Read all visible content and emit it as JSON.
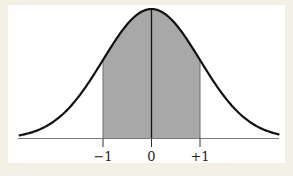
{
  "chart_data": {
    "type": "area",
    "curve": "standard-normal-bell-curve",
    "title": "",
    "xlabel": "",
    "ylabel": "",
    "x_ticks": [
      {
        "sigma": -1,
        "label": "−1"
      },
      {
        "sigma": 0,
        "label": "0"
      },
      {
        "sigma": 1,
        "label": "+1"
      }
    ],
    "shaded_region": {
      "from_sigma": -1,
      "to_sigma": 1
    },
    "center_line_at_sigma": 0,
    "x_domain_sigma": [
      -2.72,
      2.62
    ],
    "grid": false,
    "legend": false,
    "layout": {
      "canvas_w": 293,
      "canvas_h": 176,
      "x0_px": 151.5,
      "sigma_px": 48.5,
      "axis_y_px": 138.5,
      "peak_px": 129.5,
      "axis_x1_px": 18,
      "axis_x2_px": 279,
      "tick_len_px": 8.5,
      "label_baseline_px": 161
    },
    "colors": {
      "frame": "#f3f0e5",
      "panel": "#ffffff",
      "fill": "#a8a8a8",
      "curve": "#111111",
      "axis": "#7a7a7a",
      "boundary": "#6e6e6e",
      "tick": "#333333",
      "label": "#1d1d1d"
    }
  }
}
